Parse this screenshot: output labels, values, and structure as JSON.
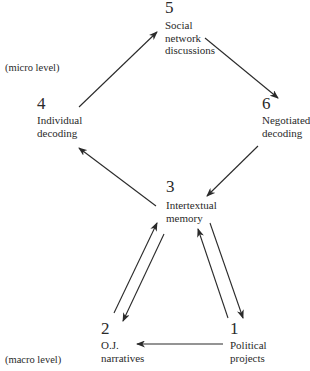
{
  "diagram": {
    "levels": {
      "micro": "(micro level)",
      "macro": "(macro level)"
    },
    "nodes": {
      "n1": {
        "number": "1",
        "lines": [
          "Political",
          "projects"
        ]
      },
      "n2": {
        "number": "2",
        "lines": [
          "O.J.",
          "narratives"
        ]
      },
      "n3": {
        "number": "3",
        "lines": [
          "Intertextual",
          "memory"
        ]
      },
      "n4": {
        "number": "4",
        "lines": [
          "Individual",
          "decoding"
        ]
      },
      "n5": {
        "number": "5",
        "lines": [
          "Social",
          "network",
          "discussions"
        ]
      },
      "n6": {
        "number": "6",
        "lines": [
          "Negotiated",
          "decoding"
        ]
      }
    },
    "edges": [
      {
        "from": "4",
        "to": "5"
      },
      {
        "from": "5",
        "to": "6"
      },
      {
        "from": "6",
        "to": "3"
      },
      {
        "from": "3",
        "to": "4"
      },
      {
        "from": "2",
        "to": "3"
      },
      {
        "from": "3",
        "to": "2"
      },
      {
        "from": "1",
        "to": "3"
      },
      {
        "from": "3",
        "to": "1"
      },
      {
        "from": "1",
        "to": "2"
      }
    ],
    "colors": {
      "ink": "#2a2a2a",
      "background": "#ffffff"
    }
  }
}
